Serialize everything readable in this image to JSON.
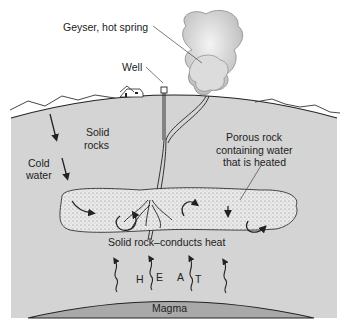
{
  "diagram": {
    "labels": {
      "geyser": "Geyser, hot spring",
      "well": "Well",
      "solid_rocks_1": "Solid",
      "solid_rocks_2": "rocks",
      "cold_water_1": "Cold",
      "cold_water_2": "water",
      "porous_1": "Porous rock",
      "porous_2": "containing water",
      "porous_3": "that is heated",
      "conducts": "Solid rock–conducts heat",
      "heat_h": "H",
      "heat_e": "E",
      "heat_a": "A",
      "heat_t": "T",
      "magma": "Magma"
    },
    "colors": {
      "rock": "#d4d4d4",
      "magma": "#a9a9a9",
      "porous": "#e6e6e6",
      "steam": "#cfcfcf",
      "line": "#222222"
    }
  }
}
